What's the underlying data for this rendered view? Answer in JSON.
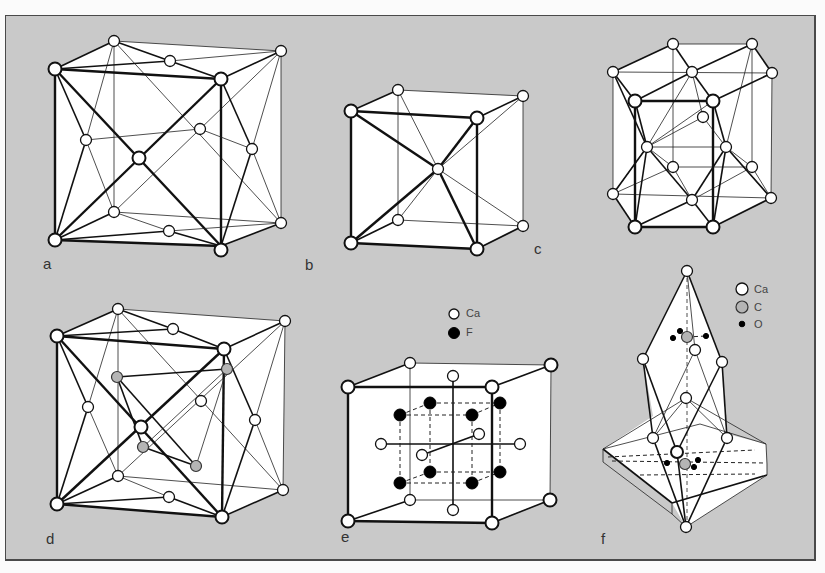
{
  "figure": {
    "background_color": "#c9c9c9",
    "panels": [
      {
        "id": "a",
        "label": "a"
      },
      {
        "id": "b",
        "label": "b"
      },
      {
        "id": "c",
        "label": "c"
      },
      {
        "id": "d",
        "label": "d"
      },
      {
        "id": "e",
        "label": "e",
        "legend": [
          {
            "symbol": "open-circle",
            "text": "Ca"
          },
          {
            "symbol": "filled-circle",
            "text": "F"
          }
        ]
      },
      {
        "id": "f",
        "label": "f",
        "legend": [
          {
            "symbol": "open-circle",
            "text": "Ca"
          },
          {
            "symbol": "grey-circle",
            "text": "C"
          },
          {
            "symbol": "small-dot",
            "text": "O"
          }
        ]
      }
    ]
  }
}
